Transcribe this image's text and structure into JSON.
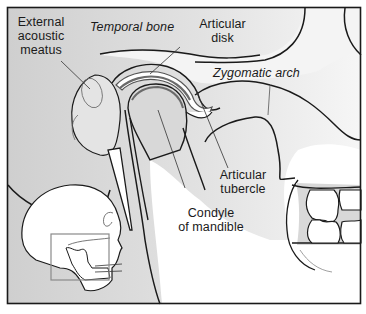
{
  "figure": {
    "colors": {
      "frame": "#1a1a1a",
      "bone_gray": "#d4d4d4",
      "bone_gray_light": "#e6e6e6",
      "white": "#ffffff",
      "disk_dark": "#6a6a6a",
      "inset_box": "#8a8a8a",
      "text": "#1a1a1a"
    },
    "labels": {
      "external_acoustic_meatus": [
        "External",
        "acoustic",
        "meatus"
      ],
      "temporal_bone": "Temporal bone",
      "articular_disk": [
        "Articular",
        "disk"
      ],
      "zygomatic_arch": "Zygomatic arch",
      "articular_tubercle": [
        "Articular",
        "tubercle"
      ],
      "condyle_of_mandible": [
        "Condyle",
        "of mandible"
      ]
    },
    "inset": {
      "description": "Skull profile with highlighted TMJ region"
    }
  }
}
